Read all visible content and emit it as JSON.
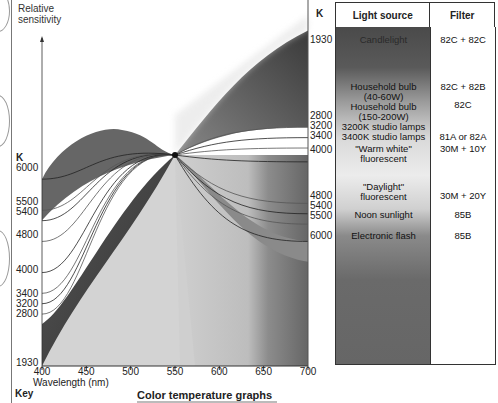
{
  "chart_data": {
    "type": "line",
    "title": "Color temperature graphs",
    "ylabel": "Relative sensitivity",
    "xlabel": "Wavelength (nm)",
    "x_ticks": [
      400,
      450,
      500,
      550,
      600,
      650,
      700
    ],
    "xlim": [
      400,
      700
    ],
    "pivot_wavelength": 550,
    "left_axis_unit": "K",
    "left_axis_labels": [
      "6000",
      "5500",
      "5400",
      "4800",
      "4000",
      "3400",
      "3200",
      "2800",
      "1930"
    ],
    "right_axis_unit": "K",
    "right_axis_labels": [
      "1930",
      "2800",
      "3200",
      "3400",
      "4000",
      "4800",
      "5400",
      "5500",
      "6000"
    ],
    "series": [
      {
        "name": "1930K",
        "start_rel": 0.0,
        "end_rel": 0.97
      },
      {
        "name": "2800K",
        "start_rel": 0.15,
        "end_rel": 0.69
      },
      {
        "name": "3200K",
        "start_rel": 0.18,
        "end_rel": 0.66
      },
      {
        "name": "3400K",
        "start_rel": 0.21,
        "end_rel": 0.63
      },
      {
        "name": "4000K",
        "start_rel": 0.27,
        "end_rel": 0.59
      },
      {
        "name": "4800K",
        "start_rel": 0.36,
        "end_rel": 0.47
      },
      {
        "name": "5400K",
        "start_rel": 0.42,
        "end_rel": 0.44
      },
      {
        "name": "5500K",
        "start_rel": 0.45,
        "end_rel": 0.41
      },
      {
        "name": "6000K",
        "start_rel": 0.54,
        "end_rel": 0.36
      }
    ],
    "legend": "none",
    "grid": false
  },
  "labels": {
    "y_title_line1": "Relative",
    "y_title_line2": "sensitivity",
    "k_left": "K",
    "k_right": "K",
    "key": "Key"
  },
  "table": {
    "headers": {
      "source": "Light source",
      "filter": "Filter"
    },
    "rows": [
      {
        "source": "Candlelight",
        "filter": "82C + 82C"
      },
      {
        "source": "Household bulb (40-60W)",
        "filter": "82C + 82B"
      },
      {
        "source": "Household bulb (150-200W)",
        "filter": "82C"
      },
      {
        "source": "3200K studio lamps",
        "filter": ""
      },
      {
        "source": "3400K studio lamps",
        "filter": "81A or 82A"
      },
      {
        "source": "\"Warm white\" fluorescent",
        "filter": "30M + 10Y"
      },
      {
        "source": "\"Daylight\" fluorescent",
        "filter": "30M + 20Y"
      },
      {
        "source": "Noon sunlight",
        "filter": "85B"
      },
      {
        "source": "Electronic flash",
        "filter": "85B"
      }
    ]
  }
}
